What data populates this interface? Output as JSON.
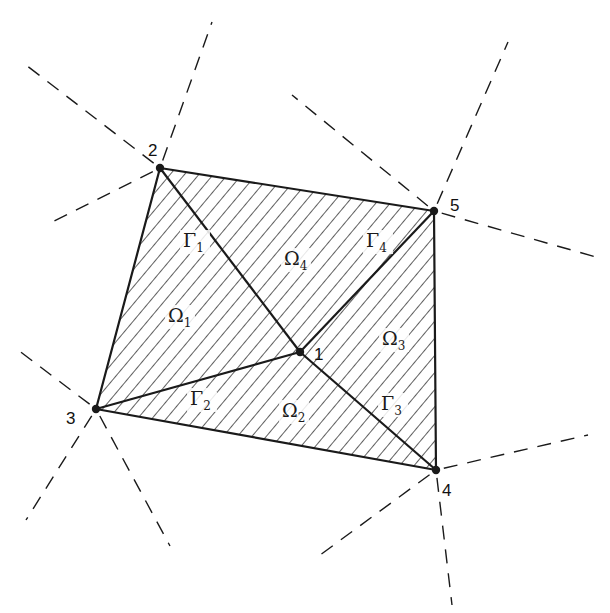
{
  "diagram": {
    "type": "finite-element patch around interior node",
    "colors": {
      "ink": "#1a1a1a",
      "background": "#ffffff"
    },
    "nodes": [
      {
        "id": "1",
        "label": "1",
        "x": 300,
        "y": 352,
        "label_dx": 14,
        "label_dy": 8
      },
      {
        "id": "2",
        "label": "2",
        "x": 160,
        "y": 168,
        "label_dx": -12,
        "label_dy": -12
      },
      {
        "id": "3",
        "label": "3",
        "x": 96,
        "y": 409,
        "label_dx": -30,
        "label_dy": 15
      },
      {
        "id": "4",
        "label": "4",
        "x": 436,
        "y": 470,
        "label_dx": 6,
        "label_dy": 26
      },
      {
        "id": "5",
        "label": "5",
        "x": 434,
        "y": 211,
        "label_dx": 16,
        "label_dy": 0
      }
    ],
    "outer_boundary": [
      "2",
      "5",
      "4",
      "3"
    ],
    "interior_edges": [
      {
        "from": "1",
        "to": "2",
        "label": "Γ",
        "sub": "1",
        "lx": 183,
        "ly": 247
      },
      {
        "from": "1",
        "to": "3",
        "label": "Γ",
        "sub": "2",
        "lx": 190,
        "ly": 405
      },
      {
        "from": "1",
        "to": "4",
        "label": "Γ",
        "sub": "3",
        "lx": 381,
        "ly": 410
      },
      {
        "from": "1",
        "to": "5",
        "label": "Γ",
        "sub": "4",
        "lx": 366,
        "ly": 247
      }
    ],
    "regions": [
      {
        "label": "Ω",
        "sub": "1",
        "x": 168,
        "y": 322
      },
      {
        "label": "Ω",
        "sub": "2",
        "x": 282,
        "y": 417
      },
      {
        "label": "Ω",
        "sub": "3",
        "x": 382,
        "y": 345
      },
      {
        "label": "Ω",
        "sub": "4",
        "x": 284,
        "y": 265
      }
    ],
    "dashed_rays": [
      {
        "x1": 160,
        "y1": 168,
        "x2": 26,
        "y2": 65
      },
      {
        "x1": 160,
        "y1": 168,
        "x2": 212,
        "y2": 22
      },
      {
        "x1": 160,
        "y1": 168,
        "x2": 48,
        "y2": 224
      },
      {
        "x1": 434,
        "y1": 211,
        "x2": 292,
        "y2": 95
      },
      {
        "x1": 434,
        "y1": 211,
        "x2": 508,
        "y2": 42
      },
      {
        "x1": 434,
        "y1": 211,
        "x2": 596,
        "y2": 257
      },
      {
        "x1": 96,
        "y1": 409,
        "x2": 18,
        "y2": 350
      },
      {
        "x1": 96,
        "y1": 409,
        "x2": 26,
        "y2": 520
      },
      {
        "x1": 96,
        "y1": 409,
        "x2": 170,
        "y2": 546
      },
      {
        "x1": 436,
        "y1": 470,
        "x2": 588,
        "y2": 435
      },
      {
        "x1": 436,
        "y1": 470,
        "x2": 316,
        "y2": 558
      },
      {
        "x1": 436,
        "y1": 470,
        "x2": 452,
        "y2": 605
      }
    ]
  }
}
